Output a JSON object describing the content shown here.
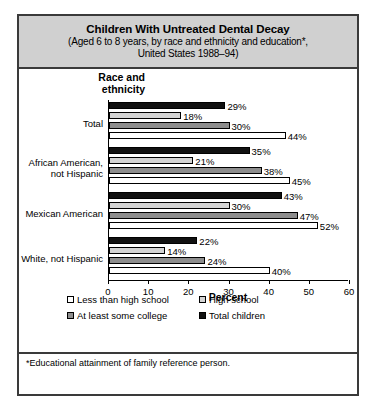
{
  "figure": {
    "title_main": "Children With Untreated Dental Decay",
    "title_sub_line1": "(Aged 6 to 8 years, by race and ethnicity and education*,",
    "title_sub_line2": "United States 1988–94)",
    "axis_group_title_line1": "Race and",
    "axis_group_title_line2": "ethnicity",
    "footnote": "*Educational attainment of family reference person."
  },
  "chart_data": {
    "type": "bar",
    "orientation": "horizontal",
    "title": "Children With Untreated Dental Decay",
    "subtitle": "(Aged 6 to 8 years, by race and ethnicity and education*, United States 1988–94)",
    "xlabel": "Percent",
    "ylabel": "Race and ethnicity",
    "xlim": [
      0,
      60
    ],
    "xticks": [
      0,
      10,
      20,
      30,
      40,
      50,
      60
    ],
    "xtick_labels": [
      "0",
      "10",
      "20",
      "30",
      "40",
      "50",
      "60"
    ],
    "grid": false,
    "legend_position": "bottom",
    "categories": [
      "Total",
      "African American, not Hispanic",
      "Mexican American",
      "White, not Hispanic"
    ],
    "category_labels": [
      [
        "Total"
      ],
      [
        "African American,",
        "not Hispanic"
      ],
      [
        "Mexican American"
      ],
      [
        "White, not Hispanic"
      ]
    ],
    "series": [
      {
        "name": "Total children",
        "key": "total",
        "color": "#111111",
        "values": [
          29,
          35,
          43,
          22
        ],
        "labels": [
          "29%",
          "35%",
          "43%",
          "22%"
        ]
      },
      {
        "name": "High school",
        "key": "high",
        "color": "#d4d4d4",
        "values": [
          18,
          21,
          30,
          14
        ],
        "labels": [
          "18%",
          "21%",
          "30%",
          "14%"
        ]
      },
      {
        "name": "At least some college",
        "key": "college",
        "color": "#8d8d8d",
        "values": [
          30,
          38,
          47,
          24
        ],
        "labels": [
          "30%",
          "38%",
          "47%",
          "24%"
        ]
      },
      {
        "name": "Less than high school",
        "key": "lessthan",
        "color": "#ffffff",
        "values": [
          44,
          45,
          52,
          40
        ],
        "labels": [
          "44%",
          "45%",
          "52%",
          "40%"
        ]
      }
    ]
  },
  "legend": {
    "items": [
      {
        "label": "Less than high school",
        "key": "lessthan"
      },
      {
        "label": "High school",
        "key": "high"
      },
      {
        "label": "At least some college",
        "key": "college"
      },
      {
        "label": "Total children",
        "key": "total"
      }
    ]
  }
}
